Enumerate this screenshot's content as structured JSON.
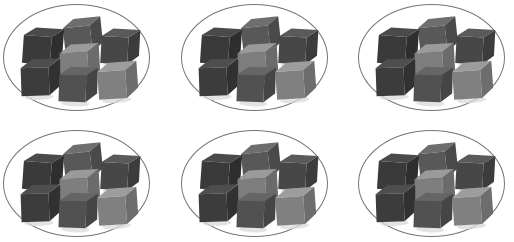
{
  "scene": {
    "title": "Seven cubes grouped in six ovals",
    "description": "Six oval rings, each containing seven small gray three-dimensional cubes arranged in the same scattered pattern.",
    "canvas_width": 514,
    "canvas_height": 242,
    "background_color": "#ffffff",
    "group_count": 6,
    "cubes_per_group": 7,
    "total_cubes": 42,
    "rows": 2,
    "columns": 3
  },
  "style": {
    "ellipse_stroke_color": "#757575",
    "ellipse_stroke_width": 1.6,
    "ellipse_fill": "transparent",
    "shadow_color": "#d9d9d9"
  },
  "groups": [
    {
      "id": "group-1",
      "label": "Group 1",
      "row": 1,
      "column": 1,
      "x": 3,
      "y": 4,
      "width": 147,
      "height": 107,
      "cube_count": 7
    },
    {
      "id": "group-2",
      "label": "Group 2",
      "row": 1,
      "column": 2,
      "x": 181,
      "y": 4,
      "width": 147,
      "height": 107,
      "cube_count": 7
    },
    {
      "id": "group-3",
      "label": "Group 3",
      "row": 1,
      "column": 3,
      "x": 358,
      "y": 4,
      "width": 147,
      "height": 107,
      "cube_count": 7
    },
    {
      "id": "group-4",
      "label": "Group 4",
      "row": 2,
      "column": 1,
      "x": 3,
      "y": 130,
      "width": 147,
      "height": 107,
      "cube_count": 7
    },
    {
      "id": "group-5",
      "label": "Group 5",
      "row": 2,
      "column": 2,
      "x": 181,
      "y": 130,
      "width": 147,
      "height": 107,
      "cube_count": 7
    },
    {
      "id": "group-6",
      "label": "Group 6",
      "row": 2,
      "column": 3,
      "x": 358,
      "y": 130,
      "width": 147,
      "height": 107,
      "cube_count": 7
    }
  ],
  "cube_layout": [
    {
      "index": 1,
      "name": "cube-top-center",
      "x": 61,
      "y": 14,
      "size": 27,
      "rotation": -6,
      "top_color": "#6e6e6e",
      "left_color": "#585858",
      "right_color": "#4a4a4a"
    },
    {
      "index": 2,
      "name": "cube-upper-left",
      "x": 20,
      "y": 24,
      "size": 28,
      "rotation": 4,
      "top_color": "#4a4a4a",
      "left_color": "#3a3a3a",
      "right_color": "#2e2e2e"
    },
    {
      "index": 3,
      "name": "cube-upper-right",
      "x": 98,
      "y": 25,
      "size": 27,
      "rotation": 3,
      "top_color": "#5a5a5a",
      "left_color": "#474747",
      "right_color": "#3c3c3c"
    },
    {
      "index": 4,
      "name": "cube-middle-center",
      "x": 57,
      "y": 40,
      "size": 28,
      "rotation": -3,
      "top_color": "#9a9a9a",
      "left_color": "#7e7e7e",
      "right_color": "#6b6b6b"
    },
    {
      "index": 5,
      "name": "cube-lower-left",
      "x": 18,
      "y": 55,
      "size": 28,
      "rotation": -2,
      "top_color": "#4e4e4e",
      "left_color": "#3c3c3c",
      "right_color": "#313131"
    },
    {
      "index": 6,
      "name": "cube-bottom-center",
      "x": 56,
      "y": 63,
      "size": 27,
      "rotation": 2,
      "top_color": "#656565",
      "left_color": "#515151",
      "right_color": "#454545"
    },
    {
      "index": 7,
      "name": "cube-lower-right",
      "x": 95,
      "y": 58,
      "size": 28,
      "rotation": -4,
      "top_color": "#9d9d9d",
      "left_color": "#808080",
      "right_color": "#6d6d6d"
    }
  ]
}
